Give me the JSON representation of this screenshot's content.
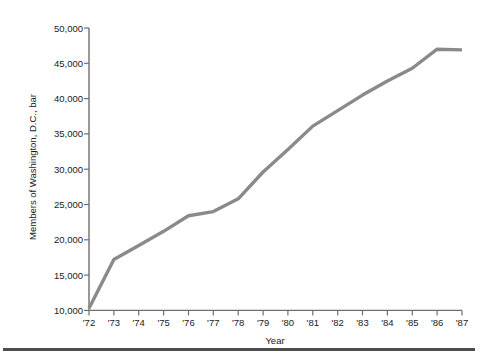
{
  "chart_data": {
    "type": "line",
    "title": "",
    "xlabel": "Year",
    "ylabel": "Members of Washington, D.C., bar",
    "x": [
      "'72",
      "'73",
      "'74",
      "'75",
      "'76",
      "'77",
      "'78",
      "'79",
      "'80",
      "'81",
      "'82",
      "'83",
      "'84",
      "'85",
      "'86",
      "'87"
    ],
    "categories": [
      "'72",
      "'73",
      "'74",
      "'75",
      "'76",
      "'77",
      "'78",
      "'79",
      "'80",
      "'81",
      "'82",
      "'83",
      "'84",
      "'85",
      "'86",
      "'87"
    ],
    "values": [
      10300,
      17200,
      19200,
      21200,
      23400,
      24000,
      25800,
      29600,
      32800,
      36100,
      38300,
      40500,
      42500,
      44300,
      47000,
      46900
    ],
    "series": [
      {
        "name": "Members of Washington, D.C., bar",
        "values": [
          10300,
          17200,
          19200,
          21200,
          23400,
          24000,
          25800,
          29600,
          32800,
          36100,
          38300,
          40500,
          42500,
          44300,
          47000,
          46900
        ]
      }
    ],
    "ylim": [
      10000,
      50000
    ],
    "xlim": [
      "'72",
      "'87"
    ],
    "ytick_values": [
      10000,
      15000,
      20000,
      25000,
      30000,
      35000,
      40000,
      45000,
      50000
    ],
    "ytick_labels": [
      "10,000",
      "15,000",
      "20,000",
      "25,000",
      "30,000",
      "35,000",
      "40,000",
      "45,000",
      "50,000"
    ],
    "xtick_labels": [
      "'72",
      "'73",
      "'74",
      "'75",
      "'76",
      "'77",
      "'78",
      "'79",
      "'80",
      "'81",
      "'82",
      "'83",
      "'84",
      "'85",
      "'86",
      "'87"
    ],
    "grid": false,
    "legend": false,
    "legend_position": "none",
    "line_color": "#8a8a8a",
    "axis_color": "#6f6f6f",
    "text_color": "#1a1a1a",
    "footer_rule_color": "#4d4d4d"
  }
}
